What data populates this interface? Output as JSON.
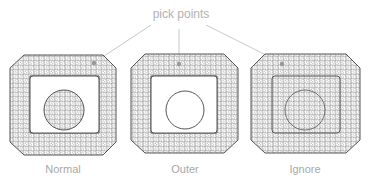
{
  "title": "pick points",
  "colors": {
    "background": "#ffffff",
    "stroke": "#555555",
    "mesh": "#777777",
    "leader": "#c8c8c8",
    "label": "#a8a8a8",
    "pick_point": "#999999"
  },
  "panels": [
    {
      "label": "Normal",
      "outer_meshed": true,
      "inner_rect_meshed": false,
      "circle_meshed": true
    },
    {
      "label": "Outer",
      "outer_meshed": true,
      "inner_rect_meshed": false,
      "circle_meshed": false
    },
    {
      "label": "Ignore",
      "outer_meshed": true,
      "inner_rect_meshed": true,
      "circle_meshed": false
    }
  ]
}
